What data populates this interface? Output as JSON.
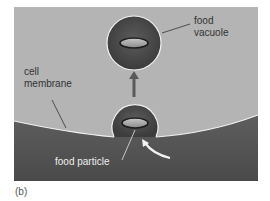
{
  "figure": {
    "panel_label": "(b)",
    "labels": {
      "food_vacuole_line1": "food",
      "food_vacuole_line2": "vacuole",
      "cell_membrane_line1": "cell",
      "cell_membrane_line2": "membrane",
      "food_particle": "food particle"
    },
    "colors": {
      "background": "#b4b4b4",
      "cytoplasm": "#555555",
      "vacuole": "#484848",
      "membrane_line": "#f2f2f2",
      "particle": "#9a9a9a",
      "arrow": "#5a5a5a",
      "label_dark": "#333333",
      "label_light": "#eeeeee"
    }
  }
}
